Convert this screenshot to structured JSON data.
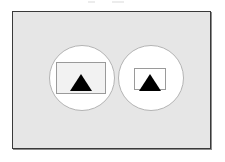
{
  "figure": {
    "title": "",
    "panel": {
      "name": "outer-frame",
      "fill_color": "#e6e6e6",
      "border_color": "#3a3a3a"
    },
    "shapes": [
      {
        "id": "left-group",
        "circle": {
          "name": "left-circle",
          "fill_color": "#ffffff",
          "stroke_color": "#b4b4b4",
          "diameter": 66
        },
        "rectangle": {
          "name": "large-rectangle",
          "size_label": "large",
          "fill_color": "#f2f2f2",
          "stroke_color": "#9a9a9a",
          "width": 50,
          "height": 32
        },
        "triangle": {
          "name": "black-triangle",
          "fill_color": "#000000",
          "width": 22,
          "height": 17
        }
      },
      {
        "id": "right-group",
        "circle": {
          "name": "right-circle",
          "fill_color": "#ffffff",
          "stroke_color": "#b4b4b4",
          "diameter": 66
        },
        "rectangle": {
          "name": "small-rectangle",
          "size_label": "small",
          "fill_color": "#ffffff",
          "stroke_color": "#9a9a9a",
          "width": 32,
          "height": 22
        },
        "triangle": {
          "name": "black-triangle",
          "fill_color": "#000000",
          "width": 22,
          "height": 17
        }
      }
    ]
  }
}
